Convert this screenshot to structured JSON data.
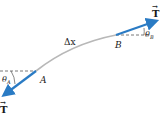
{
  "diagram": {
    "labels": {
      "tension_right": "T",
      "tension_left": "T",
      "delta_x": "Δx",
      "point_a": "A",
      "point_b": "B",
      "theta_a": "θ",
      "theta_a_sub": "A",
      "theta_b": "θ",
      "theta_b_sub": "B",
      "vector_arrow": "→"
    },
    "colors": {
      "arrow": "#2a7bc4",
      "string": "#b8b8b8",
      "dashed": "#555555",
      "text": "#1a1a1a"
    }
  }
}
